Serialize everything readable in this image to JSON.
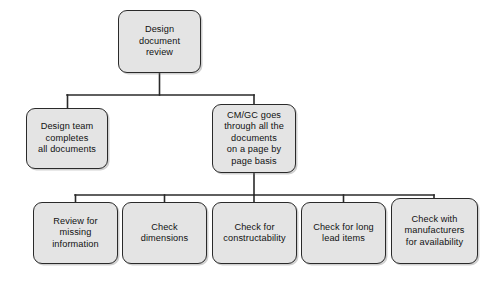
{
  "diagram": {
    "type": "flowchart",
    "orientation": "top-down",
    "background_color": "#ffffff",
    "node_fill_color": "#e4e4e4",
    "node_border_color": "#2a2a2a",
    "connector_color": "#2a2a2a",
    "levels": 3,
    "nodes": [
      {
        "id": "design-document-review",
        "label": "Design\ndocument\nreview",
        "level": 1,
        "x": 118,
        "y": 10,
        "w": 83,
        "h": 63
      },
      {
        "id": "design-team-completes-all-documents",
        "label": "Design team\ncompletes\nall documents",
        "level": 2,
        "x": 26,
        "y": 108,
        "w": 82,
        "h": 61
      },
      {
        "id": "cmgc-goes-through-all-documents",
        "label": "CM/GC goes\nthrough all the\ndocuments\non a page by\npage basis",
        "level": 2,
        "x": 212,
        "y": 104,
        "w": 84,
        "h": 69
      },
      {
        "id": "review-for-missing-information",
        "label": "Review for\nmissing\ninformation",
        "level": 3,
        "x": 33,
        "y": 202,
        "w": 85,
        "h": 62
      },
      {
        "id": "check-dimensions",
        "label": "Check\ndimensions",
        "level": 3,
        "x": 122,
        "y": 202,
        "w": 85,
        "h": 62
      },
      {
        "id": "check-for-constructability",
        "label": "Check for\nconstructability",
        "level": 3,
        "x": 212,
        "y": 202,
        "w": 85,
        "h": 62
      },
      {
        "id": "check-for-long-lead-items",
        "label": "Check for long\nlead items",
        "level": 3,
        "x": 301,
        "y": 202,
        "w": 85,
        "h": 62
      },
      {
        "id": "check-with-manufacturers-for-availability",
        "label": "Check with\nmanufacturers\nfor availability",
        "level": 3,
        "x": 391,
        "y": 198,
        "w": 87,
        "h": 66
      }
    ],
    "connectors": [
      {
        "id": "root-to-level2-bus",
        "from": "design-document-review",
        "to": [
          "design-team-completes-all-documents",
          "cmgc-goes-through-all-documents"
        ],
        "bus_y": 95,
        "bus_x_start": 67,
        "bus_x_end": 254,
        "trunk_x": 159,
        "trunk_y_start": 73,
        "trunk_y_end": 95
      },
      {
        "id": "cmgc-to-level3-bus",
        "from": "cmgc-goes-through-all-documents",
        "to": [
          "review-for-missing-information",
          "check-dimensions",
          "check-for-constructability",
          "check-for-long-lead-items",
          "check-with-manufacturers-for-availability"
        ],
        "bus_y": 195,
        "bus_x_start": 75,
        "bus_x_end": 434,
        "trunk_x": 254,
        "trunk_y_start": 173,
        "trunk_y_end": 195
      }
    ]
  }
}
